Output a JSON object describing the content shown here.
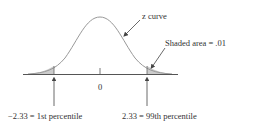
{
  "diagram": {
    "type": "standard-normal-curve",
    "curve_label": "z curve",
    "shaded_area_label": "Shaded area = .01",
    "center_tick_label": "0",
    "left_cutoff_label": "−2.33 = 1st percentile",
    "right_cutoff_label": "2.33 = 99th percentile",
    "colors": {
      "curve": "#999999",
      "axis": "#555555",
      "shade": "#cccccc",
      "text": "#333333"
    }
  }
}
